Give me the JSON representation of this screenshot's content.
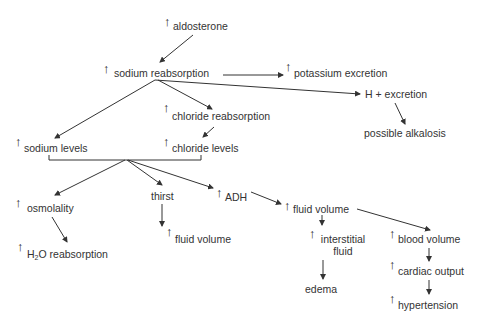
{
  "diagram": {
    "background": "#ffffff",
    "line_color": "#333333",
    "marker": "↑",
    "nodes": {
      "aldosterone": {
        "label": "aldosterone",
        "increase": true
      },
      "sodium_reabsorption": {
        "label": "sodium reabsorption",
        "increase": true
      },
      "potassium_excretion": {
        "label": "potassium excretion",
        "increase": true
      },
      "h_excretion": {
        "label": "H + excretion",
        "increase": false
      },
      "possible_alkalosis": {
        "label": "possible alkalosis",
        "increase": false
      },
      "chloride_reabsorption": {
        "label": "chloride reabsorption",
        "increase": true
      },
      "sodium_levels": {
        "label": "sodium levels",
        "increase": true
      },
      "chloride_levels": {
        "label": "chloride levels",
        "increase": true
      },
      "osmolality": {
        "label": "osmolality",
        "increase": true
      },
      "thirst": {
        "label": "thirst",
        "increase": false
      },
      "adh": {
        "label": "ADH",
        "increase": true
      },
      "fluid_volume_main": {
        "label": "fluid volume",
        "increase": true
      },
      "fluid_volume_thirst": {
        "label": "fluid volume",
        "increase": true
      },
      "h2o_reabsorption": {
        "label_prefix": "H",
        "label_sub": "2",
        "label_suffix": "O reabsorption",
        "increase": true
      },
      "interstitial_fluid": {
        "label_line1": "interstitial",
        "label_line2": "fluid",
        "increase": true
      },
      "blood_volume": {
        "label": "blood volume",
        "increase": true
      },
      "edema": {
        "label": "edema",
        "increase": false
      },
      "cardiac_output": {
        "label": "cardiac output",
        "increase": true
      },
      "hypertension": {
        "label": "hypertension",
        "increase": true
      }
    }
  }
}
